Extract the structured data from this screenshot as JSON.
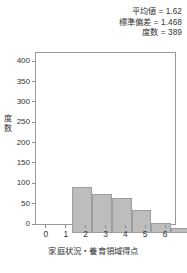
{
  "stats": {
    "mean_line": "平均値 = 1.62",
    "sd_line": "標準偏差 = 1.468",
    "n_line": "度数 = 389"
  },
  "axes": {
    "y_label_chars": [
      "度",
      "数"
    ],
    "x_label": "家庭状況・養育領域得点"
  },
  "colors": {
    "bar_fill": "#bdbdbd",
    "bar_border": "#9d9d9d",
    "frame": "#9a9a9a",
    "text": "#333333",
    "plot_background": "#ffffff"
  },
  "chart_data": {
    "type": "bar",
    "title": "",
    "subtitle": "",
    "xlabel": "家庭状況・養育領域得点",
    "ylabel": "度数",
    "categories": [
      "0",
      "1",
      "2",
      "3",
      "4",
      "5",
      "6"
    ],
    "values": [
      112,
      97,
      86,
      57,
      25,
      13,
      7
    ],
    "xlim": [
      -0.5,
      6.5
    ],
    "ylim": [
      0,
      420
    ],
    "yticks": [
      0,
      50,
      100,
      150,
      200,
      250,
      300,
      350,
      400
    ],
    "ytick_labels": [
      "0",
      "50",
      "100",
      "150",
      "200",
      "250",
      "300",
      "350",
      "400"
    ],
    "xticks": [
      0,
      1,
      2,
      3,
      4,
      5,
      6
    ],
    "xtick_labels": [
      "0",
      "1",
      "2",
      "3",
      "4",
      "5",
      "6"
    ],
    "grid": false,
    "legend": null,
    "annotations": [
      "平均値 = 1.62",
      "標準偏差 = 1.468",
      "度数 = 389"
    ]
  }
}
